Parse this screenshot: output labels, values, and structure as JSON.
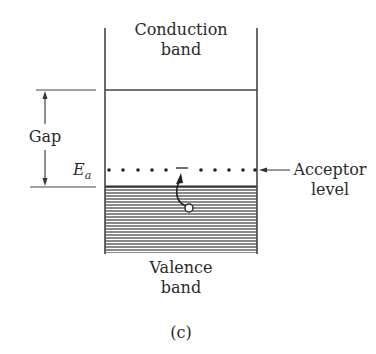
{
  "figure": {
    "caption": "(c)",
    "conduction_band": {
      "line1": "Conduction",
      "line2": "band"
    },
    "valence_band": {
      "line1": "Valence",
      "line2": "band"
    },
    "gap_label": "Gap",
    "energy_label": {
      "symbol": "E",
      "subscript": "a"
    },
    "acceptor_level": {
      "line1": "Acceptor",
      "line2": "level"
    },
    "colors": {
      "ink": "#2a2a2a",
      "hatch": "#555555",
      "background": "#ffffff"
    }
  }
}
